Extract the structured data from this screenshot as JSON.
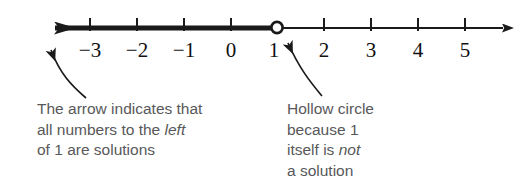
{
  "figure": {
    "type": "number-line-inequality",
    "background_color": "#ffffff",
    "line_color": "#1a1a1a",
    "caption_color": "#58585a"
  },
  "number_line": {
    "ticks": [
      {
        "value": -3,
        "label": "−3",
        "x": 90
      },
      {
        "value": -2,
        "label": "−2",
        "x": 137
      },
      {
        "value": -1,
        "label": "−1",
        "x": 184
      },
      {
        "value": 0,
        "label": "0",
        "x": 231
      },
      {
        "value": 1,
        "label": "1",
        "x": 277
      },
      {
        "value": 2,
        "label": "2",
        "x": 324
      },
      {
        "value": 3,
        "label": "3",
        "x": 371
      },
      {
        "value": 4,
        "label": "4",
        "x": 418
      },
      {
        "value": 5,
        "label": "5",
        "x": 465
      }
    ],
    "endpoint": {
      "value": 1,
      "style": "hollow-circle",
      "included": false
    },
    "shaded_direction": "left",
    "left_arrowhead": true,
    "right_arrowhead": true
  },
  "annotations": {
    "left": {
      "name": "arrow-direction-note",
      "lines": [
        "The arrow indicates that",
        "all numbers to the ",
        "of 1 are solutions"
      ],
      "line1": "The arrow indicates that",
      "line2_a": "all numbers to the ",
      "line2_em": "left",
      "line3": "of 1 are solutions"
    },
    "right": {
      "name": "hollow-circle-note",
      "line1": "Hollow circle",
      "line2": "because 1",
      "line3_a": "itself is ",
      "line3_em": "not",
      "line4": "a solution"
    }
  }
}
